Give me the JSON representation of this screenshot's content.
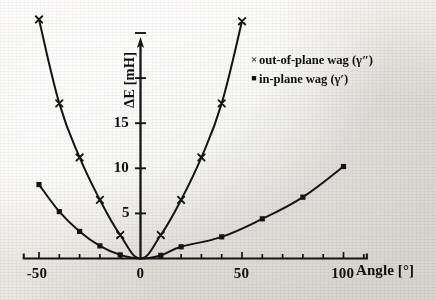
{
  "chart_data": {
    "type": "line",
    "title": "",
    "xlabel": "Angle [°]",
    "ylabel": "ΔE  [mH]",
    "xlim": [
      -58,
      112
    ],
    "ylim": [
      0,
      29
    ],
    "grid": false,
    "legend_position": "top-right",
    "x_ticks_labeled": [
      -50,
      0,
      50,
      100
    ],
    "x_tick_labels": [
      "-50",
      "0",
      "50",
      "100"
    ],
    "x_tick_step_minor": 10,
    "y_ticks_labeled": [
      5,
      10,
      15
    ],
    "y_tick_labels": [
      "5",
      "10",
      "15"
    ],
    "y_ticks_unlabeled": [
      20,
      25
    ],
    "y_tick_step": 5,
    "series": [
      {
        "name": "out-of-plane wag (γ″)",
        "marker": "cross",
        "x": [
          -50,
          -40,
          -30,
          -20,
          -10,
          0,
          10,
          20,
          30,
          40,
          50
        ],
        "values": [
          26.5,
          17.2,
          11.2,
          6.5,
          2.6,
          0.0,
          2.6,
          6.5,
          11.2,
          17.2,
          26.3
        ]
      },
      {
        "name": "in-plane wag (γ′)",
        "marker": "square",
        "x": [
          -50,
          -40,
          -30,
          -20,
          -10,
          0,
          10,
          20,
          40,
          60,
          80,
          100
        ],
        "values": [
          8.2,
          5.2,
          3.0,
          1.4,
          0.4,
          0.0,
          0.35,
          1.3,
          2.4,
          4.4,
          6.8,
          10.2
        ]
      }
    ]
  },
  "axes": {
    "y_axis_label": "ΔE  [mH]",
    "x_axis_label": "Angle [°]"
  },
  "legend": {
    "entries": [
      {
        "marker_glyph": "×",
        "marker_name": "cross-marker",
        "label": "out-of-plane wag (γ″)"
      },
      {
        "marker_glyph": "■",
        "marker_name": "square-marker",
        "label": "in-plane wag (γ′)"
      }
    ]
  },
  "ticks": {
    "y": [
      {
        "value": 15,
        "label": "15"
      },
      {
        "value": 10,
        "label": "10"
      },
      {
        "value": 5,
        "label": "5"
      }
    ],
    "x": [
      {
        "value": -50,
        "label": "-50"
      },
      {
        "value": 0,
        "label": "0"
      },
      {
        "value": 50,
        "label": "50"
      },
      {
        "value": 100,
        "label": "100"
      }
    ]
  },
  "colors": {
    "ink": "#141414",
    "paper": "#efeeea"
  }
}
